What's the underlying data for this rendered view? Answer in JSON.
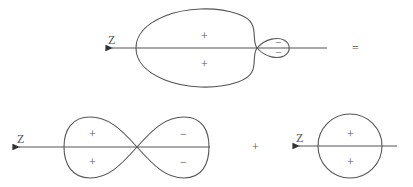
{
  "diagram": {
    "type": "orbital-decomposition",
    "equation": {
      "equals_sign": "=",
      "plus_sign": "+"
    },
    "top_orbital": {
      "axis_label": "Z",
      "large_lobe_signs": [
        "+",
        "+"
      ],
      "small_lobe_signs": [
        "−",
        "−"
      ]
    },
    "p_orbital": {
      "axis_label": "Z",
      "left_lobe_signs": [
        "+",
        "+"
      ],
      "right_lobe_signs": [
        "−",
        "−"
      ]
    },
    "s_orbital": {
      "axis_label": "Z",
      "signs": [
        "+",
        "+"
      ]
    }
  }
}
